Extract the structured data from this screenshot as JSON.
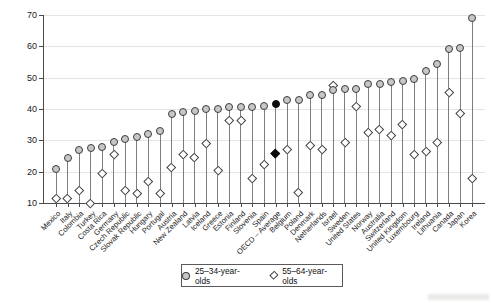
{
  "chart_data": {
    "type": "lollipop-dumbbell",
    "title": "",
    "xlabel": "",
    "ylabel": "",
    "ylim": [
      10,
      70
    ],
    "yticks": [
      10,
      20,
      30,
      40,
      50,
      60,
      70
    ],
    "grid": true,
    "legend_position": "bottom-center",
    "highlight_category": "OECD – Average",
    "highlight_index": 19,
    "categories": [
      "Mexico",
      "Italy",
      "Colombia",
      "Turkey",
      "Costa Rica",
      "Germany",
      "Czech Republic",
      "Slovak Republic",
      "Hungary",
      "Portugal",
      "Austria",
      "New Zealand",
      "Latvia",
      "Iceland",
      "Greece",
      "Estonia",
      "Finland",
      "Slovenia",
      "Spain",
      "OECD – Average",
      "Belgium",
      "Poland",
      "Denmark",
      "Netherlands",
      "Israel",
      "Sweden",
      "United States",
      "Norway",
      "Australia",
      "Switzerland",
      "United Kingdom",
      "Luxembourg",
      "Ireland",
      "Lithuania",
      "Canada",
      "Japan",
      "Korea"
    ],
    "series": [
      {
        "name": "25–34-year-olds",
        "marker": "circle",
        "values": [
          21,
          24.5,
          27,
          27.5,
          28,
          29.5,
          30.5,
          31,
          32,
          33,
          38.5,
          39,
          39.5,
          40,
          40,
          40.5,
          40.5,
          40.5,
          41,
          41.5,
          43,
          43,
          44.5,
          44.5,
          46,
          46.5,
          46.5,
          48,
          48,
          48.5,
          49,
          49.5,
          52,
          54.5,
          59,
          59.5,
          69
        ]
      },
      {
        "name": "55–64-year-olds",
        "marker": "diamond",
        "values": [
          11.5,
          11.5,
          14,
          10,
          19.5,
          25.5,
          14,
          13,
          17,
          13,
          21.5,
          25.5,
          24.5,
          29,
          20.5,
          36.5,
          36.5,
          18,
          22.5,
          26,
          27,
          13.5,
          28.5,
          27,
          47.5,
          29.5,
          41,
          32.5,
          33.5,
          31.5,
          35,
          25.5,
          26.5,
          29.5,
          45.5,
          38.5,
          18
        ]
      }
    ]
  },
  "legend": {
    "items": [
      "25–34-year-olds",
      "55–64-year-olds"
    ]
  },
  "colors": {
    "circle_fill": "#c7c7c5",
    "marker_stroke": "#3d3d3d",
    "highlight": "#0b0b0b",
    "stem": "#7d7d7d",
    "gridline": "#e4e4e2",
    "axis": "#4a4a4a",
    "text": "#1a1a1a"
  }
}
